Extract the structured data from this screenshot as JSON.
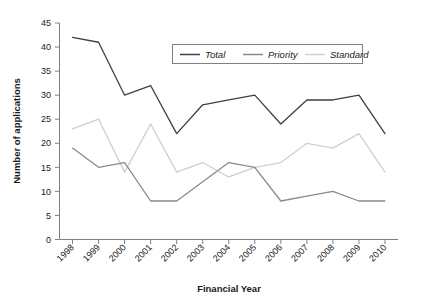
{
  "chart_data": {
    "type": "line",
    "title": "",
    "xlabel": "Financial Year",
    "ylabel": "Number of applications",
    "categories": [
      "1998",
      "1999",
      "2000",
      "2001",
      "2002",
      "2003",
      "2004",
      "2005",
      "2006",
      "2007",
      "2008",
      "2009",
      "2010"
    ],
    "ylim": [
      0,
      45
    ],
    "ytick_values": [
      0,
      5,
      10,
      15,
      20,
      25,
      30,
      35,
      40,
      45
    ],
    "ytick_labels": [
      "0",
      "5",
      "10",
      "15",
      "20",
      "25",
      "30",
      "35",
      "40",
      "45"
    ],
    "grid": false,
    "legend_position": "top-center",
    "series": [
      {
        "name": "Total",
        "color": "#3f3f3f",
        "values": [
          42,
          41,
          30,
          32,
          22,
          28,
          29,
          30,
          24,
          29,
          29,
          30,
          22
        ]
      },
      {
        "name": "Priority",
        "color": "#8a8a8a",
        "values": [
          19,
          15,
          16,
          8,
          8,
          12,
          16,
          15,
          8,
          9,
          10,
          8,
          8
        ]
      },
      {
        "name": "Standard",
        "color": "#cfcfcf",
        "values": [
          23,
          25,
          14,
          24,
          14,
          16,
          13,
          15,
          16,
          20,
          19,
          22,
          14
        ]
      }
    ]
  },
  "axes": {
    "y_title": "Number of applications",
    "x_title": "Financial Year"
  },
  "legend": {
    "items": [
      {
        "label": "Total"
      },
      {
        "label": "Priority"
      },
      {
        "label": "Standard"
      }
    ]
  },
  "colors": {
    "total": "#3f3f3f",
    "priority": "#8a8a8a",
    "standard": "#cfcfcf",
    "axis": "#808080",
    "text": "#1a1a1a"
  }
}
